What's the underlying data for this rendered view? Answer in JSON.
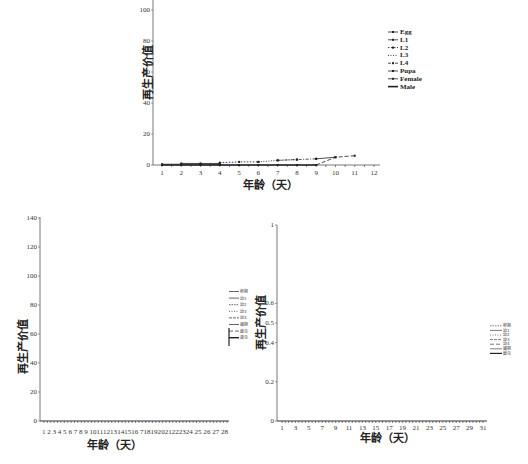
{
  "chart_data": [
    {
      "type": "line",
      "id": "top",
      "title": "",
      "xlabel": "年龄（天）",
      "ylabel": "再生产价值",
      "ylim": [
        0,
        100
      ],
      "yticks": [
        0,
        20,
        40,
        60,
        80,
        100
      ],
      "categories": [
        1,
        2,
        3,
        4,
        5,
        6,
        7,
        8,
        9,
        10,
        11,
        12
      ],
      "grid": false,
      "legend_position": "right",
      "series": [
        {
          "name": "Egg",
          "style": "solid-arrow",
          "values": [
            0.5,
            0.5,
            0.5,
            0.5,
            null,
            null,
            null,
            null,
            null,
            null,
            null,
            null
          ]
        },
        {
          "name": "L1",
          "style": "solid-dot",
          "values": [
            null,
            1,
            1,
            1,
            null,
            null,
            null,
            null,
            null,
            null,
            null,
            null
          ]
        },
        {
          "name": "L2",
          "style": "dotted-dot",
          "values": [
            null,
            null,
            null,
            1.5,
            2,
            2,
            null,
            null,
            null,
            null,
            null,
            null
          ]
        },
        {
          "name": "L3",
          "style": "dotted",
          "values": [
            null,
            null,
            null,
            null,
            null,
            2,
            3,
            3.5,
            null,
            null,
            null,
            null
          ]
        },
        {
          "name": "L4",
          "style": "dash-dot",
          "values": [
            null,
            null,
            null,
            null,
            null,
            null,
            3,
            3.5,
            4,
            null,
            null,
            null
          ]
        },
        {
          "name": "Pupa",
          "style": "solid-arrow",
          "values": [
            null,
            null,
            null,
            null,
            null,
            null,
            null,
            null,
            4,
            5,
            null,
            null
          ]
        },
        {
          "name": "Female",
          "style": "dash",
          "values": [
            null,
            null,
            null,
            null,
            null,
            null,
            null,
            null,
            0,
            5,
            6,
            null
          ]
        },
        {
          "name": "Male",
          "style": "solid-thick",
          "values": [
            0,
            0,
            0,
            0,
            0,
            0,
            0,
            0,
            0,
            null,
            null,
            null
          ]
        }
      ]
    },
    {
      "type": "line",
      "id": "bottom-left",
      "title": "",
      "xlabel": "年龄（天）",
      "ylabel": "再生产价值",
      "ylim": [
        0,
        140
      ],
      "yticks": [
        0,
        20,
        40,
        60,
        80,
        100,
        120,
        140
      ],
      "categories": [
        1,
        2,
        3,
        4,
        5,
        6,
        7,
        8,
        9,
        10,
        11,
        12,
        13,
        14,
        15,
        16,
        17,
        18,
        19,
        20,
        21,
        22,
        23,
        24,
        25,
        26,
        27,
        28
      ],
      "xtick_labels_text": "1 2 3 4 5 6 7 8 9 10111213141516 718192021222324 25 26 27 28",
      "grid": false,
      "legend_position": "right",
      "legend_entries": [
        "卵期",
        "幼1",
        "幼2",
        "幼3",
        "幼4",
        "蛹期",
        "雌虫",
        "雄虫"
      ],
      "series": [
        {
          "name": "all",
          "values": [
            0,
            0,
            0,
            0,
            0,
            0,
            0,
            0,
            0,
            0,
            0,
            0,
            0,
            0,
            0,
            0,
            0,
            0,
            0,
            0,
            0,
            0,
            0,
            0,
            0,
            0,
            0,
            0
          ]
        }
      ]
    },
    {
      "type": "line",
      "id": "bottom-right",
      "title": "",
      "xlabel": "年龄（天）",
      "ylabel": "再生产价值",
      "ylim": [
        0,
        1
      ],
      "yticks": [
        0,
        0.2,
        0.4,
        0.5,
        0.6,
        1
      ],
      "categories": [
        1,
        3,
        5,
        7,
        9,
        11,
        13,
        15,
        17,
        19,
        21,
        23,
        25,
        27,
        29,
        31
      ],
      "grid": false,
      "legend_position": "right",
      "legend_entries": [
        "卵期",
        "幼1",
        "幼2",
        "幼3",
        "幼4",
        "蛹期",
        "雌虫"
      ],
      "series": [
        {
          "name": "all",
          "values": [
            0,
            0,
            0,
            0,
            0,
            0,
            0,
            0,
            0,
            0,
            0,
            0,
            0,
            0,
            0,
            0
          ]
        }
      ]
    }
  ],
  "labels": {
    "top_xlabel": "年龄（天）",
    "top_ylabel": "再生产价值",
    "bl_xlabel": "年龄（天）",
    "bl_ylabel": "再生产价值",
    "br_xlabel": "年龄（天）",
    "br_ylabel": "再生产价值",
    "top_yticks": [
      "100",
      "80",
      "60",
      "40",
      "20",
      "0"
    ],
    "top_xticks": [
      "1",
      "2",
      "3",
      "4",
      "5",
      "6",
      "7",
      "8",
      "9",
      "10",
      "11",
      "12"
    ],
    "bl_yticks": [
      "140",
      "120",
      "100",
      "80",
      "60",
      "40",
      "20",
      "0"
    ],
    "bl_xticks_text": "1 2 3 4 5 6 7 8 9 10111213141516 718192021222324 25 26 27 28",
    "br_yticks": [
      "1",
      "0.6",
      "0.5",
      "0.4",
      "0.2",
      "0"
    ],
    "br_xticks": [
      "1",
      "3",
      "5",
      "7",
      "9",
      "11",
      "13",
      "15",
      "17",
      "19",
      "21",
      "23",
      "25",
      "27",
      "29",
      "31"
    ],
    "top_legend": [
      "Egg",
      "L1",
      "L2",
      "L3",
      "L4",
      "Pupa",
      "Female",
      "Male"
    ],
    "bl_legend": [
      "卵期",
      "幼1",
      "幼2",
      "幼3",
      "幼4",
      "蛹期",
      "雌虫",
      "雄虫"
    ],
    "br_legend": [
      "卵期",
      "幼1",
      "幼2",
      "幼3",
      "幼4",
      "蛹期",
      "雌虫"
    ]
  }
}
